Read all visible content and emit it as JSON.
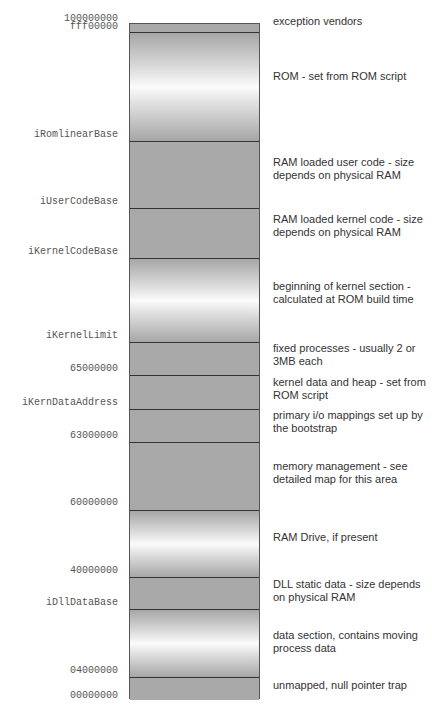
{
  "addresses": [
    {
      "label": "100000000",
      "y": 19
    },
    {
      "label": "fff00000",
      "y": 27
    },
    {
      "label": "iRomlinearBase",
      "y": 135
    },
    {
      "label": "iUserCodeBase",
      "y": 202
    },
    {
      "label": "iKernelCodeBase",
      "y": 252
    },
    {
      "label": "iKernelLimit",
      "y": 336
    },
    {
      "label": "65000000",
      "y": 369
    },
    {
      "label": "iKernDataAddress",
      "y": 403
    },
    {
      "label": "63000000",
      "y": 436
    },
    {
      "label": "60000000",
      "y": 503
    },
    {
      "label": "40000000",
      "y": 571
    },
    {
      "label": "iDllDataBase",
      "y": 603
    },
    {
      "label": "04000000",
      "y": 671
    },
    {
      "label": "00000000",
      "y": 696
    }
  ],
  "regions": [
    {
      "top": 0,
      "height": 8,
      "style": "solid",
      "description": "exception vendors",
      "desc_y": 21
    },
    {
      "top": 8,
      "height": 109,
      "style": "grad",
      "description": "ROM - set from ROM script",
      "desc_y": 76
    },
    {
      "top": 117,
      "height": 67,
      "style": "solid",
      "description": "RAM loaded user code - size depends on physical RAM",
      "desc_y": 162
    },
    {
      "top": 184,
      "height": 50,
      "style": "solid",
      "description": "RAM loaded kernel code - size depends on physical RAM",
      "desc_y": 219
    },
    {
      "top": 234,
      "height": 84,
      "style": "grad",
      "description": "beginning of kernel section - calculated at ROM build time",
      "desc_y": 286
    },
    {
      "top": 318,
      "height": 33,
      "style": "solid",
      "description": "fixed processes - usually 2 or 3MB each",
      "desc_y": 348
    },
    {
      "top": 351,
      "height": 34,
      "style": "solid",
      "description": "kernel data and heap - set from ROM script",
      "desc_y": 382
    },
    {
      "top": 385,
      "height": 33,
      "style": "solid",
      "description": "primary i/o mappings set up by the bootstrap",
      "desc_y": 415
    },
    {
      "top": 418,
      "height": 68,
      "style": "solid",
      "description": "memory management - see detailed map for this area",
      "desc_y": 466
    },
    {
      "top": 486,
      "height": 67,
      "style": "grad",
      "description": "RAM Drive, if present",
      "desc_y": 537
    },
    {
      "top": 553,
      "height": 32,
      "style": "solid",
      "description": "DLL static data - size depends on physical RAM",
      "desc_y": 584
    },
    {
      "top": 585,
      "height": 68,
      "style": "grad",
      "description": "data section, contains moving process data",
      "desc_y": 635
    },
    {
      "top": 653,
      "height": 23,
      "style": "solid",
      "description": "unmapped, null pointer trap",
      "desc_y": 685
    }
  ]
}
